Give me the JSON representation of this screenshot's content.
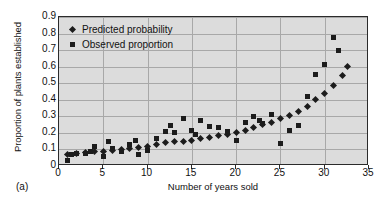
{
  "caption": "(a)",
  "chart_data": {
    "type": "scatter",
    "title": "",
    "xlabel": "Number of years sold",
    "ylabel": "Proportion of plants established",
    "xlim": [
      0,
      35
    ],
    "ylim": [
      0,
      0.9
    ],
    "xticks": [
      0,
      5,
      10,
      15,
      20,
      25,
      30,
      35
    ],
    "xtick_labels": [
      "0",
      "5",
      "10",
      "15",
      "20",
      "25",
      "30",
      "35"
    ],
    "yticks": [
      0,
      0.1,
      0.2,
      0.3,
      0.4,
      0.5,
      0.6,
      0.7,
      0.8,
      0.9
    ],
    "ytick_labels": [
      "0",
      "0.1",
      "0.2",
      "0.3",
      "0.4",
      "0.5",
      "0.6",
      "0.7",
      "0.8",
      "0.9"
    ],
    "grid": "horizontal-and-vertical",
    "plot_background": "#dcdcdc",
    "marker_color": "#1c1c1c",
    "legend_position": "inside-top-left",
    "legend": [
      {
        "label": "Predicted probability",
        "marker": "diamond"
      },
      {
        "label": "Observed proportion",
        "marker": "square"
      }
    ],
    "series": [
      {
        "name": "Predicted probability",
        "marker": "diamond",
        "points": [
          [
            1,
            0.07
          ],
          [
            2,
            0.075
          ],
          [
            3,
            0.08
          ],
          [
            4,
            0.085
          ],
          [
            5,
            0.09
          ],
          [
            6,
            0.095
          ],
          [
            7,
            0.1
          ],
          [
            8,
            0.105
          ],
          [
            9,
            0.11
          ],
          [
            10,
            0.12
          ],
          [
            11,
            0.13
          ],
          [
            12,
            0.14
          ],
          [
            13,
            0.145
          ],
          [
            14,
            0.15
          ],
          [
            15,
            0.155
          ],
          [
            16,
            0.165
          ],
          [
            17,
            0.175
          ],
          [
            18,
            0.185
          ],
          [
            19,
            0.19
          ],
          [
            20,
            0.2
          ],
          [
            21,
            0.215
          ],
          [
            22,
            0.235
          ],
          [
            23,
            0.25
          ],
          [
            24,
            0.265
          ],
          [
            25,
            0.285
          ],
          [
            26,
            0.305
          ],
          [
            27,
            0.33
          ],
          [
            28,
            0.36
          ],
          [
            29,
            0.4
          ],
          [
            30,
            0.44
          ],
          [
            31,
            0.485
          ],
          [
            32,
            0.545
          ],
          [
            32.6,
            0.6
          ]
        ]
      },
      {
        "name": "Observed proportion",
        "marker": "square",
        "points": [
          [
            1,
            0.035
          ],
          [
            1.4,
            0.07
          ],
          [
            2,
            0.075
          ],
          [
            3,
            0.075
          ],
          [
            3.6,
            0.085
          ],
          [
            4,
            0.12
          ],
          [
            5,
            0.06
          ],
          [
            5.6,
            0.15
          ],
          [
            6,
            0.105
          ],
          [
            7,
            0.085
          ],
          [
            8,
            0.13
          ],
          [
            8.6,
            0.155
          ],
          [
            9,
            0.07
          ],
          [
            10,
            0.095
          ],
          [
            11,
            0.165
          ],
          [
            12,
            0.21
          ],
          [
            12.6,
            0.245
          ],
          [
            13,
            0.2
          ],
          [
            14,
            0.285
          ],
          [
            15,
            0.215
          ],
          [
            15.4,
            0.19
          ],
          [
            16,
            0.275
          ],
          [
            17,
            0.24
          ],
          [
            18,
            0.235
          ],
          [
            19,
            0.21
          ],
          [
            20,
            0.155
          ],
          [
            21,
            0.265
          ],
          [
            22,
            0.3
          ],
          [
            22.6,
            0.275
          ],
          [
            23,
            0.255
          ],
          [
            24,
            0.31
          ],
          [
            25,
            0.135
          ],
          [
            26,
            0.215
          ],
          [
            27,
            0.245
          ],
          [
            28,
            0.42
          ],
          [
            29,
            0.555
          ],
          [
            30,
            0.615
          ],
          [
            31,
            0.775
          ],
          [
            31.6,
            0.7
          ]
        ]
      }
    ]
  }
}
